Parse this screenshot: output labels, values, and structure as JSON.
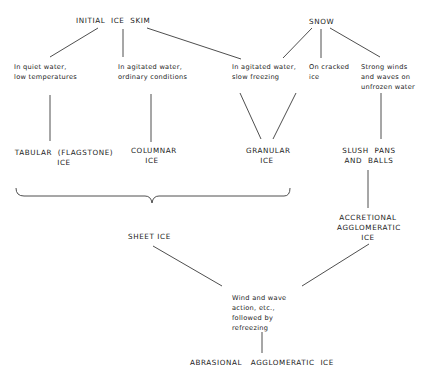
{
  "diagram": {
    "type": "flowchart",
    "nodes": {
      "initial_ice_skim": "INITIAL  ICE  SKIM",
      "snow": "SNOW",
      "quiet_water": "In quiet water,\nlow temperatures",
      "agitated_ordinary": "In agitated water,\nordinary conditions",
      "agitated_slow": "In agitated water,\nslow freezing",
      "cracked_ice": "On cracked\nice",
      "strong_winds": "Strong winds\nand waves on\nunfrozen water",
      "tabular_ice": "TABULAR  (FLAGSTONE)\nICE",
      "columnar_ice": "COLUMNAR\nICE",
      "granular_ice": "GRANULAR\nICE",
      "slush_pans": "SLUSH  PANS\nAND  BALLS",
      "accretional_ice": "ACCRETIONAL\nAGGLOMERATIC\nICE",
      "sheet_ice": "SHEET ICE",
      "wind_wave_action": "Wind and wave\naction, etc.,\nfollowed by\nrefreezing",
      "abrasional_ice": "ABRASIONAL   AGGLOMERATIC  ICE"
    },
    "edges": [
      [
        "initial_ice_skim",
        "quiet_water"
      ],
      [
        "initial_ice_skim",
        "agitated_ordinary"
      ],
      [
        "initial_ice_skim",
        "agitated_slow"
      ],
      [
        "snow",
        "agitated_slow"
      ],
      [
        "snow",
        "cracked_ice"
      ],
      [
        "snow",
        "strong_winds"
      ],
      [
        "quiet_water",
        "tabular_ice"
      ],
      [
        "agitated_ordinary",
        "columnar_ice"
      ],
      [
        "agitated_slow",
        "granular_ice"
      ],
      [
        "strong_winds",
        "slush_pans"
      ],
      [
        "slush_pans",
        "accretional_ice"
      ],
      [
        "tabular_ice|columnar_ice|granular_ice",
        "sheet_ice"
      ],
      [
        "sheet_ice",
        "wind_wave_action"
      ],
      [
        "accretional_ice",
        "wind_wave_action"
      ],
      [
        "wind_wave_action",
        "abrasional_ice"
      ]
    ]
  }
}
